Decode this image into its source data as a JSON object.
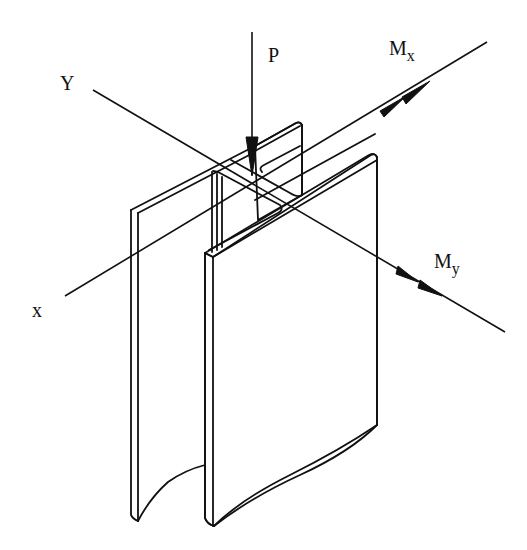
{
  "figure": {
    "type": "isometric structural diagram",
    "colors": {
      "line": "#111111",
      "background": "#ffffff"
    }
  },
  "labels": {
    "load": "P",
    "moment_x": {
      "base": "M",
      "sub": "x"
    },
    "moment_y": {
      "base": "M",
      "sub": "y"
    },
    "axis_x": "x",
    "axis_y": "Y"
  }
}
